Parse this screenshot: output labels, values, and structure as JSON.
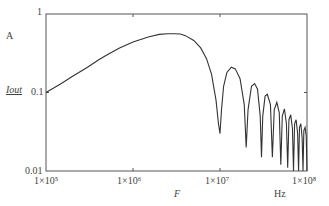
{
  "chart_data": {
    "type": "line",
    "title": "",
    "xlabel": "F",
    "xunit": "Hz",
    "ylabel": "Iout",
    "yunit": "A",
    "xscale": "log",
    "yscale": "log",
    "xlim": [
      100000,
      100000000
    ],
    "ylim": [
      0.01,
      1
    ],
    "grid": false,
    "legend": null,
    "x_ticks": [
      "1×10⁵",
      "1×10⁶",
      "1×10⁷",
      "1×10⁸"
    ],
    "y_ticks": [
      "0.01",
      "0.1",
      "1"
    ],
    "series": [
      {
        "name": "Iout",
        "points": [
          [
            100000,
            0.1
          ],
          [
            150000,
            0.13
          ],
          [
            200000,
            0.16
          ],
          [
            300000,
            0.21
          ],
          [
            400000,
            0.26
          ],
          [
            500000,
            0.3
          ],
          [
            700000,
            0.37
          ],
          [
            1000000,
            0.44
          ],
          [
            1500000,
            0.51
          ],
          [
            2000000,
            0.55
          ],
          [
            2500000,
            0.56
          ],
          [
            3000000,
            0.56
          ],
          [
            3500000,
            0.555
          ],
          [
            4000000,
            0.53
          ],
          [
            5000000,
            0.46
          ],
          [
            6000000,
            0.37
          ],
          [
            7000000,
            0.27
          ],
          [
            8000000,
            0.17
          ],
          [
            9000000,
            0.08
          ],
          [
            9600000,
            0.04
          ],
          [
            10000000,
            0.03
          ],
          [
            10400000,
            0.06
          ],
          [
            11000000,
            0.12
          ],
          [
            12000000,
            0.18
          ],
          [
            13500000,
            0.21
          ],
          [
            15000000,
            0.2
          ],
          [
            17000000,
            0.15
          ],
          [
            19000000,
            0.07
          ],
          [
            20000000,
            0.02
          ],
          [
            21000000,
            0.06
          ],
          [
            23000000,
            0.12
          ],
          [
            25000000,
            0.13
          ],
          [
            27000000,
            0.11
          ],
          [
            29000000,
            0.05
          ],
          [
            30000000,
            0.015
          ],
          [
            31000000,
            0.05
          ],
          [
            33000000,
            0.09
          ],
          [
            35000000,
            0.095
          ],
          [
            38000000,
            0.07
          ],
          [
            40000000,
            0.015
          ],
          [
            42000000,
            0.06
          ],
          [
            45000000,
            0.075
          ],
          [
            48000000,
            0.055
          ],
          [
            50000000,
            0.012
          ],
          [
            52000000,
            0.05
          ],
          [
            55000000,
            0.062
          ],
          [
            58000000,
            0.04
          ],
          [
            60000000,
            0.011
          ],
          [
            62000000,
            0.045
          ],
          [
            65000000,
            0.052
          ],
          [
            68000000,
            0.035
          ],
          [
            70000000,
            0.01
          ],
          [
            72000000,
            0.04
          ],
          [
            75000000,
            0.045
          ],
          [
            78000000,
            0.03
          ],
          [
            80000000,
            0.01
          ],
          [
            82000000,
            0.036
          ],
          [
            85000000,
            0.04
          ],
          [
            88000000,
            0.026
          ],
          [
            90000000,
            0.01
          ],
          [
            92000000,
            0.033
          ],
          [
            95000000,
            0.036
          ],
          [
            98000000,
            0.028
          ],
          [
            100000000,
            0.01
          ]
        ]
      }
    ]
  },
  "labels": {
    "y_unit": "A",
    "y_axis": "Iout",
    "x_axis": "F",
    "x_unit": "Hz",
    "y_tick_1": "1",
    "y_tick_01": "0.1",
    "y_tick_001": "0.01",
    "x_tick_1e5": "1×10⁵",
    "x_tick_1e6": "1×10⁶",
    "x_tick_1e7": "1×10⁷",
    "x_tick_1e8": "1×10⁸"
  },
  "colors": {
    "line": "#333333",
    "axis": "#555555"
  }
}
